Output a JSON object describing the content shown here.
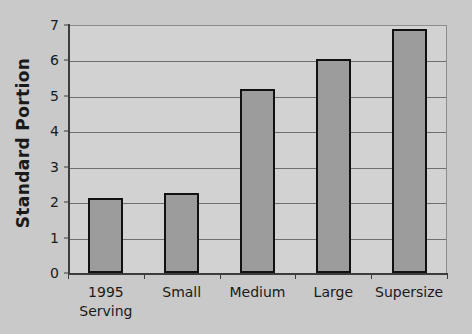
{
  "chart_data": {
    "type": "bar",
    "title": "",
    "xlabel": "",
    "ylabel": "Standard Portion",
    "categories": [
      "1995\nServing",
      "Small",
      "Medium",
      "Large",
      "Supersize"
    ],
    "values": [
      2.12,
      2.25,
      5.2,
      6.05,
      6.9
    ],
    "ylim": [
      0,
      7
    ],
    "yticks": [
      0,
      1,
      2,
      3,
      4,
      5,
      6,
      7
    ],
    "ytick_labels": [
      "0",
      "1",
      "2",
      "3",
      "4",
      "5",
      "6",
      "7"
    ],
    "grid": "horizontal",
    "legend": "none",
    "bar_color": "#9c9c9c",
    "bar_edge_color": "#111111",
    "plot_background": "#d2d2d2",
    "figure_background": "#c9c9c9"
  }
}
